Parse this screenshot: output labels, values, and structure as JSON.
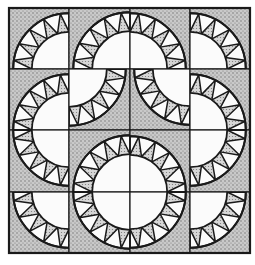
{
  "colors": {
    "background": "#ffffff",
    "ink": "#1a1a1a",
    "stipple_bg": "#c9c9c9",
    "stipple_dot": "#6a6a6a",
    "white": "#fbfbfb"
  },
  "grid": {
    "rows": 4,
    "cols": 4,
    "x_lines": [
      9,
      69,
      130,
      190,
      250
    ],
    "y_lines": [
      8,
      69,
      130,
      192,
      253
    ],
    "outer_radius_ratio": 0.93,
    "inner_radius_ratio": 0.62,
    "triangles_per_band": 5
  },
  "cells": [
    [
      "BR",
      "BR",
      "BL",
      "BL"
    ],
    [
      "BR",
      "TL",
      "TR",
      "BL"
    ],
    [
      "TR",
      "BR",
      "BL",
      "TL"
    ],
    [
      "TR",
      "TR",
      "TL",
      "TL"
    ]
  ]
}
